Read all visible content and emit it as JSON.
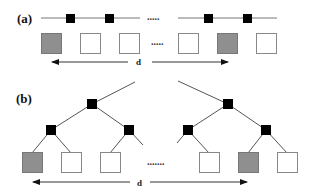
{
  "panels": [
    {
      "label": "(a)",
      "ellipsis_top": ".....",
      "ellipsis_boxes": ".....",
      "distance_label": "d"
    },
    {
      "label": "(b)",
      "ellipsis_leaves": ".......",
      "distance_label": "d"
    }
  ],
  "colors": {
    "node": "#000000",
    "edge": "#555555",
    "box_border": "#888888",
    "box_highlight": "#8f8f8f",
    "box_plain": "#ffffff"
  }
}
